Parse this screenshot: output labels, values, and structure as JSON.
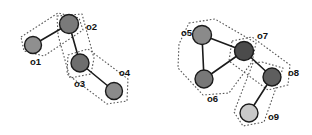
{
  "diagram": {
    "type": "node-link-diagram",
    "width": 312,
    "height": 135,
    "background_color": "#ffffff",
    "edge_color": "#1b1b1b",
    "outline_color": "#555555",
    "label_color": "#111111",
    "nodes": [
      {
        "id": "o1",
        "label": "o1",
        "x": 33,
        "y": 45,
        "r": 8.5,
        "fill": "#8f8f8f",
        "label_x": 30,
        "label_y": 62
      },
      {
        "id": "o2",
        "label": "o2",
        "x": 69,
        "y": 24,
        "r": 9.5,
        "fill": "#7a7a7a",
        "label_x": 86,
        "label_y": 27
      },
      {
        "id": "o3",
        "label": "o3",
        "x": 80,
        "y": 63,
        "r": 9.0,
        "fill": "#6e6e6e",
        "label_x": 74,
        "label_y": 84
      },
      {
        "id": "o4",
        "label": "o4",
        "x": 114,
        "y": 91,
        "r": 8.5,
        "fill": "#8b8b8b",
        "label_x": 119,
        "label_y": 73
      },
      {
        "id": "o5",
        "label": "o5",
        "x": 202,
        "y": 35,
        "r": 9.5,
        "fill": "#8a8a8a",
        "label_x": 181,
        "label_y": 33
      },
      {
        "id": "o6",
        "label": "o6",
        "x": 204,
        "y": 79,
        "r": 9.0,
        "fill": "#787878",
        "label_x": 207,
        "label_y": 99
      },
      {
        "id": "o7",
        "label": "o7",
        "x": 244,
        "y": 51,
        "r": 9.5,
        "fill": "#4b4b4b",
        "label_x": 257,
        "label_y": 36
      },
      {
        "id": "o8",
        "label": "o8",
        "x": 272,
        "y": 77,
        "r": 9.0,
        "fill": "#5e5e5e",
        "label_x": 288,
        "label_y": 73
      },
      {
        "id": "o9",
        "label": "o9",
        "x": 249,
        "y": 113,
        "r": 9.0,
        "fill": "#c9c9c9",
        "label_x": 268,
        "label_y": 117
      }
    ],
    "edges": [
      {
        "id": "e1",
        "source": "o1",
        "target": "o2"
      },
      {
        "id": "e2",
        "source": "o2",
        "target": "o3"
      },
      {
        "id": "e3",
        "source": "o3",
        "target": "o4"
      },
      {
        "id": "e4",
        "source": "o5",
        "target": "o6"
      },
      {
        "id": "e5",
        "source": "o5",
        "target": "o7"
      },
      {
        "id": "e6",
        "source": "o6",
        "target": "o7"
      },
      {
        "id": "e7",
        "source": "o7",
        "target": "o8"
      },
      {
        "id": "e8",
        "source": "o8",
        "target": "o9"
      }
    ],
    "clusters": [
      {
        "id": "c1",
        "name": "cluster-o1-o2",
        "members": [
          "o1",
          "o2"
        ],
        "points": "21,37 58,13 79,18 83,30 44,56 24,51"
      },
      {
        "id": "c2",
        "name": "cluster-o2-o3",
        "points": "57,16 82,14 94,58 91,74 70,78 58,35"
      },
      {
        "id": "c3",
        "name": "cluster-o3-o4",
        "members": [
          "o3",
          "o4"
        ],
        "points": "68,55 88,49 128,79 127,101 107,104 67,74"
      },
      {
        "id": "c4",
        "name": "cluster-o5-o6-o7",
        "members": [
          "o5",
          "o6",
          "o7"
        ],
        "points": "189,23 215,19 256,43 252,62 229,93 203,95 178,68 179,44"
      },
      {
        "id": "c5",
        "name": "cluster-o7-o8",
        "members": [
          "o7",
          "o8"
        ],
        "points": "232,41 252,37 290,65 288,85 268,90 229,61"
      },
      {
        "id": "c6",
        "name": "cluster-o8-o9",
        "members": [
          "o8",
          "o9"
        ],
        "points": "262,62 283,68 264,122 243,126 234,112 253,63"
      }
    ]
  }
}
